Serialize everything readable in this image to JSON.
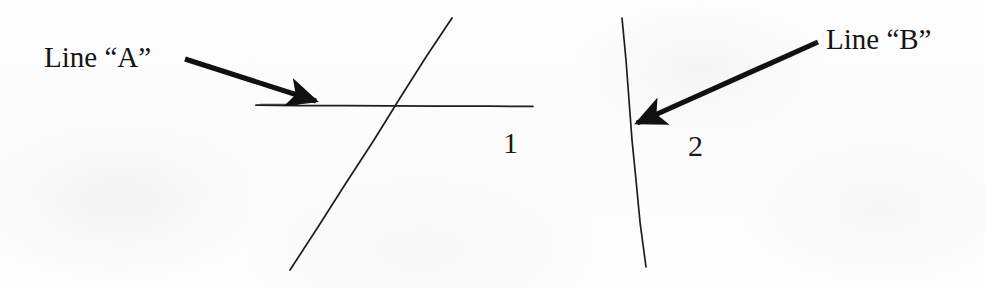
{
  "figure": {
    "domain": "Diagram",
    "background_color": "#fdfdfd",
    "ink_color": "#1a1a1a",
    "width": 985,
    "height": 288
  },
  "panels": [
    {
      "number_label": "1",
      "number_x": 503,
      "number_y": 128,
      "callout": {
        "text": "Line “A”",
        "text_x": 44,
        "text_y": 43,
        "arrow_from": [
          185,
          59
        ],
        "arrow_to": [
          322,
          103
        ]
      },
      "lines": [
        {
          "name": "line-a-horizontal",
          "from": [
            256,
            105
          ],
          "to": [
            533,
            106
          ],
          "stroke_width": 1.6
        },
        {
          "name": "line-a-diagonal",
          "from": [
            290,
            270
          ],
          "to": [
            452,
            18
          ],
          "stroke_width": 1.6
        }
      ]
    },
    {
      "number_label": "2",
      "number_x": 688,
      "number_y": 131,
      "callout": {
        "text": "Line “B”",
        "text_x": 826,
        "text_y": 25,
        "arrow_from": [
          818,
          42
        ],
        "arrow_to": [
          631,
          126
        ]
      },
      "lines": [
        {
          "name": "line-b-vertical",
          "from": [
            622,
            18
          ],
          "to": [
            646,
            267
          ],
          "stroke_width": 1.6
        }
      ]
    }
  ],
  "texts": {
    "line_a_label": "Line “A”",
    "line_b_label": "Line “B”",
    "figure_1_number": "1",
    "figure_2_number": "2"
  }
}
